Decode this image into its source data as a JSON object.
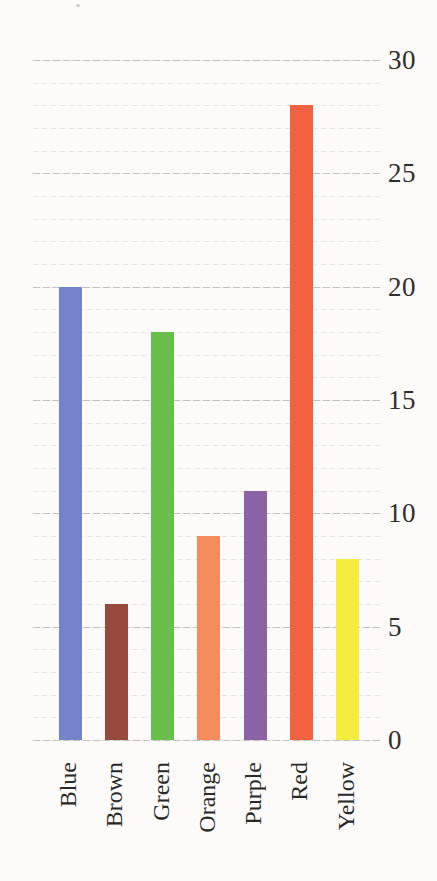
{
  "chart_data": {
    "type": "bar",
    "title": "",
    "xlabel": "",
    "ylabel": "",
    "categories": [
      "Blue",
      "Brown",
      "Green",
      "Orange",
      "Purple",
      "Red",
      "Yellow"
    ],
    "values": [
      20,
      6,
      18,
      9,
      11,
      28,
      8
    ],
    "bar_colors": [
      "#7384cb",
      "#97493c",
      "#68bf4b",
      "#f68b5f",
      "#8c63a6",
      "#f26140",
      "#f5ed3e"
    ],
    "ylim": [
      0,
      30
    ],
    "yticks": [
      "30",
      "25",
      "20",
      "15",
      "10",
      "5",
      "0"
    ],
    "ytick_values": [
      30,
      25,
      20,
      15,
      10,
      5,
      0
    ],
    "ytick_side": "right",
    "major_grid_interval": 5,
    "minor_grid_interval": 1,
    "grid": "horizontal",
    "legend": "none",
    "x_label_rotation_degrees": 90
  },
  "colors": {
    "paper_background": "#fcfbf9",
    "major_gridline": "#c3c2be",
    "minor_gridline": "#eae8e3",
    "tick_text": "#2f2e2c"
  }
}
